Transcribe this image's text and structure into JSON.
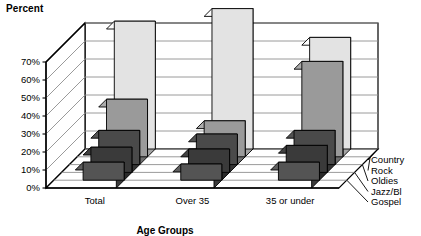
{
  "chart_data": {
    "type": "bar",
    "title": "Percent",
    "xlabel": "Age Groups",
    "ylabel": "Percent",
    "categories": [
      "Total",
      "Over 35",
      "35 or under"
    ],
    "series": [
      {
        "name": "Country",
        "values": [
          71,
          78,
          62
        ],
        "color": "#e3e3e3"
      },
      {
        "name": "Rock",
        "values": [
          32,
          20,
          53
        ],
        "color": "#9a9a9a"
      },
      {
        "name": "Oldies",
        "values": [
          19,
          17,
          19
        ],
        "color": "#4a4a4a"
      },
      {
        "name": "Jazz/Bl",
        "values": [
          14,
          13,
          15
        ],
        "color": "#3a3a3a"
      },
      {
        "name": "Gospel",
        "values": [
          10,
          9,
          10
        ],
        "color": "#545454"
      }
    ],
    "ylim": [
      0,
      70
    ],
    "ytick_labels": [
      "0%",
      "10%",
      "20%",
      "30%",
      "40%",
      "50%",
      "60%",
      "70%"
    ],
    "ytick_values": [
      0,
      10,
      20,
      30,
      40,
      50,
      60,
      70
    ],
    "grid": true,
    "legend_position": "right",
    "legend_entries": [
      "Country",
      "Rock",
      "Oldies",
      "Jazz/Bl",
      "Gospel"
    ],
    "projection": "3d"
  },
  "style": {
    "background": "#ffffff",
    "axis_color": "#000000",
    "grid_color": "#8f8f8f",
    "wall_color": "#ffffff",
    "floor_color": "#ffffff"
  }
}
